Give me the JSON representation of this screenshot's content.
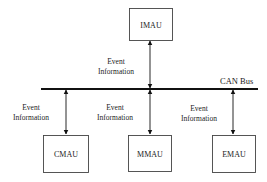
{
  "diagram": {
    "bus": {
      "label": "CAN Bus"
    },
    "nodes": [
      {
        "id": "imau",
        "label": "IMAU",
        "x": 129,
        "y": 8,
        "w": 43,
        "h": 32
      },
      {
        "id": "cmau",
        "label": "CMAU",
        "x": 43,
        "y": 135,
        "w": 45,
        "h": 37
      },
      {
        "id": "mmau",
        "label": "MMAU",
        "x": 128,
        "y": 135,
        "w": 43,
        "h": 36
      },
      {
        "id": "emau",
        "label": "EMAU",
        "x": 212,
        "y": 135,
        "w": 43,
        "h": 37
      }
    ],
    "edge_labels": [
      {
        "for": "imau",
        "line1": "Event",
        "line2": "Information"
      },
      {
        "for": "cmau",
        "line1": "Event",
        "line2": "Information"
      },
      {
        "for": "mmau",
        "line1": "Event",
        "line2": "Information"
      },
      {
        "for": "emau",
        "line1": "Event",
        "line2": "Information"
      }
    ]
  }
}
